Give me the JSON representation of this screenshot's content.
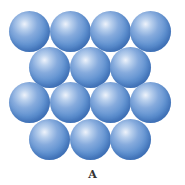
{
  "diagram": {
    "type": "close-packed sphere layer",
    "label": "A",
    "sphere_color": "#5f91d0",
    "highlight_color": "#eef3fb",
    "rows": [
      {
        "count": 4,
        "centers_x": [
          29,
          70,
          110,
          150
        ],
        "center_y": 31
      },
      {
        "count": 3,
        "centers_x": [
          49,
          90,
          130
        ],
        "center_y": 67
      },
      {
        "count": 4,
        "centers_x": [
          29,
          70,
          110,
          150
        ],
        "center_y": 102
      },
      {
        "count": 3,
        "centers_x": [
          49,
          90,
          130
        ],
        "center_y": 139
      }
    ],
    "sphere_diameter": 41,
    "total_spheres": 14
  }
}
